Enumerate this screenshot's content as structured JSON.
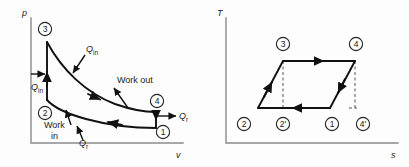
{
  "figure_pv": {
    "name": "pressure-volume-diagram",
    "y_axis_label": "p",
    "x_axis_label": "v",
    "state_labels": [
      "1",
      "2",
      "3",
      "4"
    ],
    "annotations": {
      "heat_in_boiler": "Q",
      "heat_in_boiler_sub": "in",
      "heat_in_pump": "Q",
      "heat_in_pump_sub": "in",
      "heat_rejected_lower": "Q",
      "heat_rejected_lower_sub": "r",
      "heat_rejected_right": "Q",
      "heat_rejected_right_sub": "r",
      "work_out": "Work out",
      "work_in_line1": "Work",
      "work_in_line2": "in"
    }
  },
  "figure_ts": {
    "name": "temperature-entropy-diagram",
    "y_axis_label": "T",
    "x_axis_label": "s",
    "state_labels_top": [
      "3",
      "4"
    ],
    "state_labels_bottom": [
      "2",
      "2'",
      "1",
      "4'"
    ]
  },
  "colors": {
    "background": "#fdfdfd",
    "axis": "#8a8a8a",
    "curve": "#111111",
    "dashed": "#555555",
    "text": "#1a1a1a"
  }
}
